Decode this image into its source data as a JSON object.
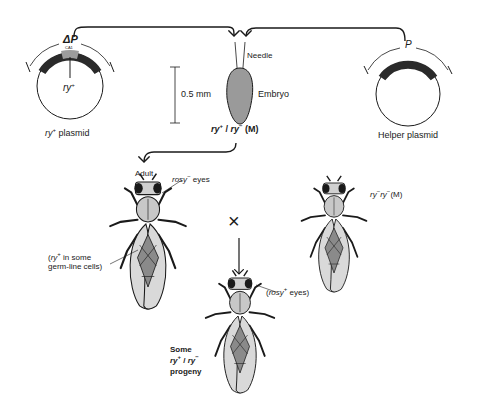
{
  "diagram": {
    "plasmids": {
      "left": {
        "element_label": "ΔP",
        "element_sublabel": "CA1",
        "insert_label": "ry",
        "insert_sup": "+",
        "caption_gene": "ry",
        "caption_sup": "+",
        "caption_text": " plasmid"
      },
      "right": {
        "element_label": "P",
        "caption": "Helper plasmid"
      }
    },
    "injection": {
      "needle_label": "Needle",
      "embryo_label": "Embryo",
      "scale_label": "0.5 mm",
      "genotype_a": "ry",
      "genotype_a_sup": "+",
      "genotype_sep": " / ",
      "genotype_b": "ry",
      "genotype_b_sup": "−",
      "genotype_suffix": " (M)"
    },
    "adult": {
      "label": "Adult",
      "eyes_gene": "rosy",
      "eyes_sup": "−",
      "eyes_text": " eyes",
      "note_open": "(",
      "note_gene": "ry",
      "note_sup": "+",
      "note_line1": " in some",
      "note_line2": "germ-line cells)"
    },
    "mate": {
      "gene_a": "ry",
      "sup_a": "−",
      "gene_b": "ry",
      "sup_b": "−",
      "suffix": "(M)"
    },
    "cross_symbol": "×",
    "progeny": {
      "eyes_open": "(",
      "eyes_gene": "rosy",
      "eyes_sup": "+",
      "eyes_text": " eyes)",
      "line1": "Some",
      "gene_a": "ry",
      "sup_a": "+",
      "sep": " / ",
      "gene_b": "ry",
      "sup_b": "−",
      "line3": "progeny"
    },
    "colors": {
      "ink": "#1a1a1a",
      "embryo_fill": "#9a9a9a",
      "insert_fill": "#9c9c9c",
      "element_fill": "#2a2a2a",
      "wing_fill": "#d9d9d9"
    }
  }
}
